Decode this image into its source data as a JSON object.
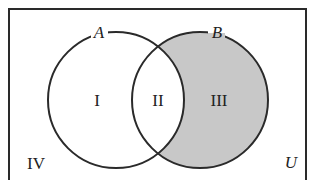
{
  "diagram": {
    "type": "venn",
    "universe_label": "U",
    "sets": [
      {
        "name": "A",
        "label": "A",
        "cx": 116,
        "cy": 100,
        "r": 68
      },
      {
        "name": "B",
        "label": "B",
        "cx": 200,
        "cy": 100,
        "r": 68
      }
    ],
    "regions": [
      {
        "id": "I",
        "label": "I",
        "description": "A only",
        "shaded": false
      },
      {
        "id": "II",
        "label": "II",
        "description": "A and B",
        "shaded": false
      },
      {
        "id": "III",
        "label": "III",
        "description": "B only",
        "shaded": true
      },
      {
        "id": "IV",
        "label": "IV",
        "description": "outside A and B",
        "shaded": false
      }
    ],
    "colors": {
      "stroke": "#2a2a2a",
      "shade": "#c8c8c8",
      "background": "#ffffff"
    }
  }
}
